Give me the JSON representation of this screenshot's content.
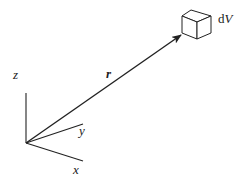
{
  "figure": {
    "labels": {
      "z_axis": "z",
      "y_axis": "y",
      "x_axis": "x",
      "position_vector": "r",
      "volume_element_d": "d",
      "volume_element_v": "V"
    },
    "colors": {
      "stroke": "#222222",
      "background": "#ffffff"
    }
  }
}
